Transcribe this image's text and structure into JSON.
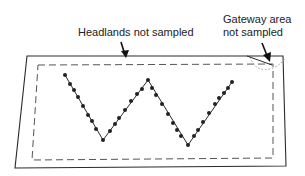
{
  "labels": {
    "headlands": "Headlands not sampled",
    "gateway_line1": "Gateway area",
    "gateway_line2": "not sampled"
  },
  "colors": {
    "line": "#2a2a2a",
    "dashed": "#555555",
    "dotted": "#999999",
    "points": "#222222"
  },
  "field": {
    "outer_boundary": [
      [
        27,
        56
      ],
      [
        283,
        56
      ],
      [
        286,
        166
      ],
      [
        15,
        168
      ]
    ],
    "inner_sampling_boundary": [
      [
        38,
        65
      ],
      [
        273,
        64
      ],
      [
        273,
        158
      ],
      [
        32,
        160
      ]
    ]
  },
  "sampling_path": {
    "shape": "W",
    "vertices": [
      [
        65,
        75
      ],
      [
        103,
        140
      ],
      [
        148,
        80
      ],
      [
        188,
        145
      ],
      [
        232,
        82
      ]
    ],
    "sample_points": [
      [
        65,
        75
      ],
      [
        70,
        84
      ],
      [
        74,
        90
      ],
      [
        78,
        97
      ],
      [
        83,
        106
      ],
      [
        88,
        115
      ],
      [
        92,
        121
      ],
      [
        96,
        129
      ],
      [
        103,
        140
      ],
      [
        110,
        131
      ],
      [
        115,
        124
      ],
      [
        119,
        118
      ],
      [
        125,
        110
      ],
      [
        131,
        101
      ],
      [
        137,
        94
      ],
      [
        142,
        89
      ],
      [
        148,
        80
      ],
      [
        152,
        88
      ],
      [
        156,
        95
      ],
      [
        162,
        104
      ],
      [
        168,
        114
      ],
      [
        173,
        123
      ],
      [
        177,
        130
      ],
      [
        181,
        136
      ],
      [
        188,
        145
      ],
      [
        194,
        136
      ],
      [
        198,
        130
      ],
      [
        203,
        122
      ],
      [
        209,
        113
      ],
      [
        215,
        104
      ],
      [
        219,
        98
      ],
      [
        224,
        93
      ],
      [
        228,
        88
      ],
      [
        232,
        82
      ]
    ]
  }
}
